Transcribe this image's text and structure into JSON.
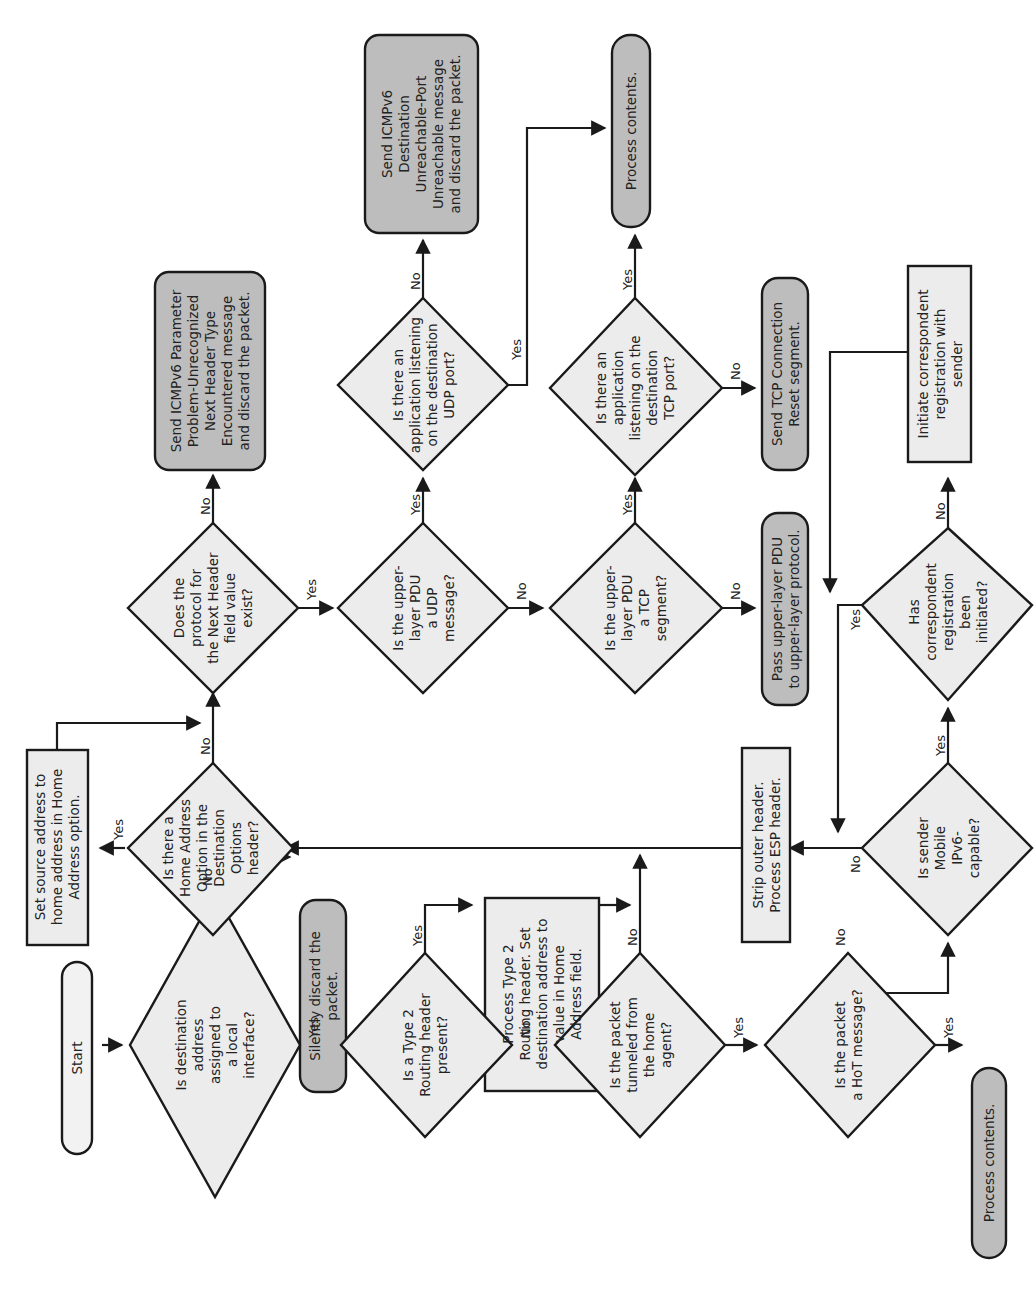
{
  "header": {
    "page_marker": "¦"
  },
  "colors": {
    "decision_fill": "#ececec",
    "process_fill": "#ececec",
    "terminal_dark_fill": "#bdbdbd",
    "start_fill": "#f2f2f2",
    "stroke": "#1a1a1a"
  },
  "nodes": {
    "start": {
      "type": "terminal",
      "lines": [
        "Start"
      ]
    },
    "d_dest_local": {
      "type": "decision",
      "lines": [
        "Is destination",
        "address",
        "assigned to",
        "a local",
        "interface?"
      ]
    },
    "t_silent_discard": {
      "type": "terminal",
      "lines": [
        "Silently discard the",
        "packet."
      ]
    },
    "d_type2_routing": {
      "type": "decision",
      "lines": [
        "Is a Type 2",
        "Routing header",
        "present?"
      ]
    },
    "p_process_type2": {
      "type": "process",
      "lines": [
        "Process Type 2",
        "Routing header. Set",
        "destination address to",
        "value in Home",
        "Address field."
      ]
    },
    "d_tunneled": {
      "type": "decision",
      "lines": [
        "Is the packet",
        "tunneled from",
        "the home",
        "agent?"
      ]
    },
    "d_hot": {
      "type": "decision",
      "lines": [
        "Is the packet",
        "a HoT message?"
      ]
    },
    "t_process_contents_bottom": {
      "type": "terminal",
      "lines": [
        "Process contents."
      ]
    },
    "d_mobile_capable": {
      "type": "decision",
      "lines": [
        "Is sender",
        "Mobile",
        "IPv6-",
        "capable?"
      ]
    },
    "d_corr_initiated": {
      "type": "decision",
      "lines": [
        "Has",
        "correspondent",
        "registration",
        "been",
        "initiated?"
      ]
    },
    "p_initiate_corr": {
      "type": "process",
      "lines": [
        "Initiate correspondent",
        "registration with",
        "sender"
      ]
    },
    "p_strip_outer": {
      "type": "process",
      "lines": [
        "Strip outer header.",
        "Process ESP header."
      ]
    },
    "d_home_addr_opt": {
      "type": "decision",
      "lines": [
        "Is there a",
        "Home Address",
        "Option in the",
        "Destination",
        "Options",
        "header?"
      ]
    },
    "p_set_source": {
      "type": "process",
      "lines": [
        "Set source address to",
        "home address in Home",
        "Address option."
      ]
    },
    "d_next_header": {
      "type": "decision",
      "lines": [
        "Does the",
        "protocol for",
        "the Next Header",
        "field value",
        "exist?"
      ]
    },
    "t_icmp_param": {
      "type": "terminal",
      "lines": [
        "Send ICMPv6 Parameter",
        "Problem-Unrecognized",
        "Next Header Type",
        "Encountered message",
        "and discard the packet."
      ]
    },
    "d_udp": {
      "type": "decision",
      "lines": [
        "Is the upper-",
        "layer PDU",
        "a UDP",
        "message?"
      ]
    },
    "d_udp_listen": {
      "type": "decision",
      "lines": [
        "Is there an",
        "application listening",
        "on the destination",
        "UDP port?"
      ]
    },
    "t_icmp_unreach": {
      "type": "terminal",
      "lines": [
        "Send ICMPv6",
        "Destination",
        "Unreachable-Port",
        "Unreachable message",
        "and discard the packet."
      ]
    },
    "d_tcp": {
      "type": "decision",
      "lines": [
        "Is the upper-",
        "layer PDU",
        "a TCP",
        "segment?"
      ]
    },
    "d_tcp_listen": {
      "type": "decision",
      "lines": [
        "Is there an",
        "application",
        "listening on the",
        "destination",
        "TCP port?"
      ]
    },
    "t_process_contents_top": {
      "type": "terminal",
      "lines": [
        "Process contents."
      ]
    },
    "t_tcp_reset": {
      "type": "terminal",
      "lines": [
        "Send TCP Connection",
        "Reset segment."
      ]
    },
    "t_pass_upper": {
      "type": "terminal",
      "lines": [
        "Pass upper-layer PDU",
        "to upper-layer protocol."
      ]
    }
  },
  "edge_labels": {
    "dest_local_yes": "Yes",
    "dest_local_no": "No",
    "type2_yes": "Yes",
    "type2_no": "No",
    "tunneled_yes": "Yes",
    "tunneled_no": "No",
    "hot_yes": "Yes",
    "hot_no": "No",
    "mobile_yes": "Yes",
    "mobile_no": "No",
    "corr_yes": "Yes",
    "corr_no": "No",
    "home_opt_yes": "Yes",
    "home_opt_no": "No",
    "next_header_yes": "Yes",
    "next_header_no": "No",
    "udp_yes": "Yes",
    "udp_no": "No",
    "udp_listen_yes": "Yes",
    "udp_listen_no": "No",
    "tcp_yes": "Yes",
    "tcp_no": "No",
    "tcp_listen_yes": "Yes",
    "tcp_listen_no": "No"
  }
}
